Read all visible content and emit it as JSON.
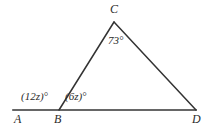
{
  "figure": {
    "type": "triangle-with-extended-base",
    "background_color": "#ffffff",
    "stroke_color": "#333333",
    "text_color": "#2b2b2b"
  },
  "vertices": {
    "A": {
      "label": "A",
      "x": 13,
      "y": 110
    },
    "B": {
      "label": "B",
      "x": 59,
      "y": 110
    },
    "C": {
      "label": "C",
      "x": 114,
      "y": 22
    },
    "D": {
      "label": "D",
      "x": 196,
      "y": 110
    }
  },
  "angles": {
    "at_C": "73°",
    "exterior_at_B": "(12z)°",
    "interior_at_B": "(6z)°"
  },
  "segments": [
    {
      "name": "base-AD",
      "from": "A",
      "to": "D"
    },
    {
      "name": "side-BC",
      "from": "B",
      "to": "C"
    },
    {
      "name": "side-CD",
      "from": "C",
      "to": "D"
    }
  ]
}
